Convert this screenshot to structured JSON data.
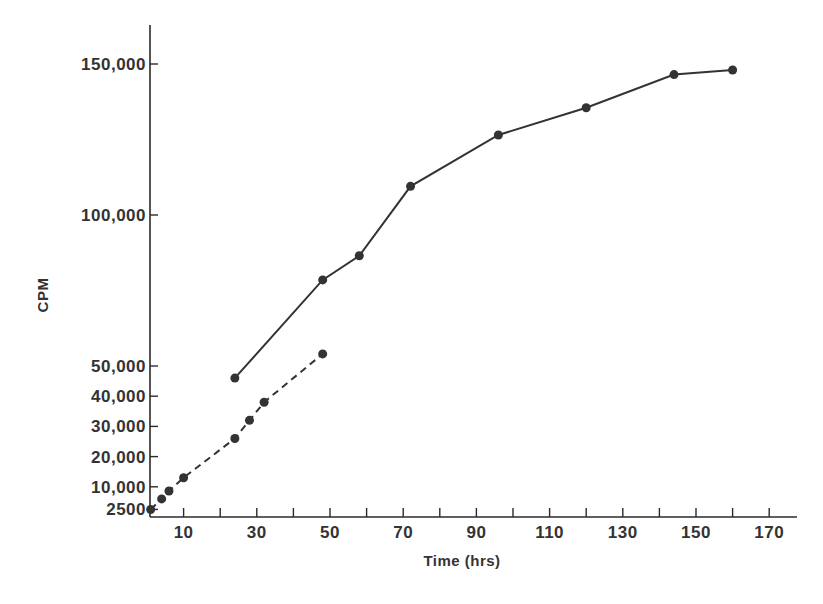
{
  "chart_data": {
    "type": "line",
    "title": "",
    "xlabel": "Time (hrs)",
    "ylabel": "CPM",
    "xlim": [
      0,
      175
    ],
    "ylim": [
      0,
      160000
    ],
    "grid": false,
    "legend": null,
    "x_ticks": {
      "labeled": [
        10,
        30,
        50,
        70,
        90,
        110,
        130,
        150,
        170
      ],
      "all": [
        10,
        20,
        30,
        40,
        50,
        60,
        70,
        80,
        90,
        100,
        110,
        120,
        130,
        140,
        150,
        160,
        170
      ]
    },
    "y_ticks": [
      {
        "value": 2500,
        "label": "2500"
      },
      {
        "value": 10000,
        "label": "10,000"
      },
      {
        "value": 20000,
        "label": "20,000"
      },
      {
        "value": 30000,
        "label": "30,000"
      },
      {
        "value": 40000,
        "label": "40,000"
      },
      {
        "value": 50000,
        "label": "50,000"
      },
      {
        "value": 100000,
        "label": "100,000"
      },
      {
        "value": 150000,
        "label": "150,000"
      }
    ],
    "series": [
      {
        "name": "solid",
        "style": "solid",
        "marker": "circle",
        "x": [
          24,
          48,
          58,
          72,
          96,
          120,
          144,
          160
        ],
        "y": [
          46000,
          78500,
          86500,
          109500,
          126500,
          135500,
          146500,
          148000
        ]
      },
      {
        "name": "dashed",
        "style": "dashed",
        "marker": "circle",
        "x": [
          1,
          4,
          6,
          10,
          24,
          28,
          32,
          48
        ],
        "y": [
          2500,
          6000,
          8600,
          13000,
          26000,
          32000,
          38000,
          54000
        ]
      }
    ]
  },
  "labels": {
    "x_axis_title": "Time (hrs)",
    "y_axis_title": "CPM"
  }
}
